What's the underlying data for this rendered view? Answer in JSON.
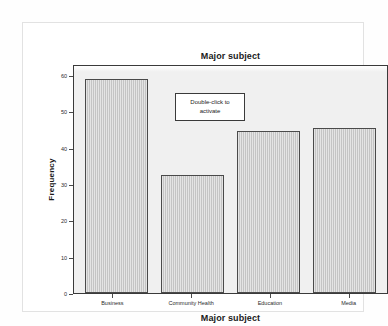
{
  "chart_data": {
    "type": "bar",
    "title": "Major subject",
    "xlabel": "Major subject",
    "ylabel": "Frequency",
    "categories": [
      "Business",
      "Community Health",
      "Education",
      "Media"
    ],
    "values": [
      59,
      32.5,
      44.5,
      45.5
    ],
    "ylim": [
      0,
      63
    ],
    "yticks": [
      0,
      10,
      20,
      30,
      40,
      50,
      60
    ],
    "ytick_labels": [
      "0",
      "10",
      "20",
      "30",
      "40",
      "50",
      "60"
    ],
    "grid": false,
    "legend": null,
    "bar_color": "#c4c4c4",
    "bar_border_color": "#4a4a4a",
    "plot_background": "#f0f0f0",
    "frame_color": "#3a3a3a"
  },
  "overlay": {
    "activate_line1": "Double-click to",
    "activate_line2": "activate"
  }
}
